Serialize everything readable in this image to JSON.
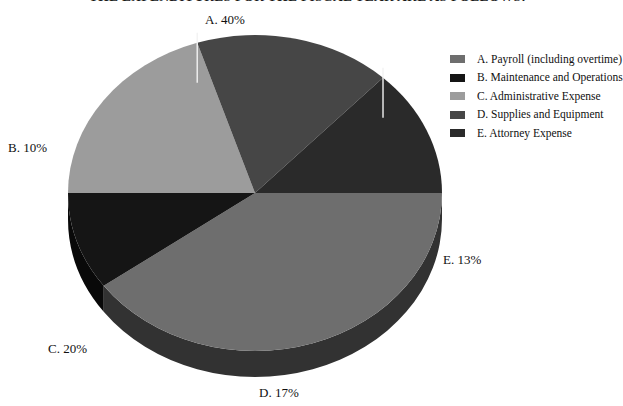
{
  "chart_data": {
    "type": "pie",
    "title": "THE EXPENDITURES FOR THE FISCAL YEAR ARE AS FOLLOWS:",
    "categories": [
      "A. Payroll (including overtime)",
      "B. Maintenance and Operations",
      "C. Administrative Expense",
      "D. Supplies and Equipment",
      "E. Attorney Expense"
    ],
    "values": [
      40,
      10,
      20,
      17,
      13
    ],
    "value_labels": [
      "A. 40%",
      "B. 10%",
      "C. 20%",
      "D. 17%",
      "E. 13%"
    ],
    "colors": [
      "#6e6e6e",
      "#151515",
      "#9c9c9c",
      "#464646",
      "#2a2a2a"
    ],
    "legend_position": "right",
    "grid": false,
    "xlabel": "",
    "ylabel": "",
    "style": "3d-extruded",
    "units": "percent"
  },
  "labels": {
    "a": "A. 40%",
    "b": "B. 10%",
    "c": "C. 20%",
    "d": "D. 17%",
    "e": "E. 13%"
  },
  "legend": {
    "items": [
      {
        "key": "A",
        "label": "A. Payroll (including overtime)",
        "color": "#6e6e6e"
      },
      {
        "key": "B",
        "label": "B. Maintenance and Operations",
        "color": "#151515"
      },
      {
        "key": "C",
        "label": "C. Administrative Expense",
        "color": "#9c9c9c"
      },
      {
        "key": "D",
        "label": "D. Supplies and Equipment",
        "color": "#464646"
      },
      {
        "key": "E",
        "label": "E. Attorney Expense",
        "color": "#2a2a2a"
      }
    ]
  }
}
